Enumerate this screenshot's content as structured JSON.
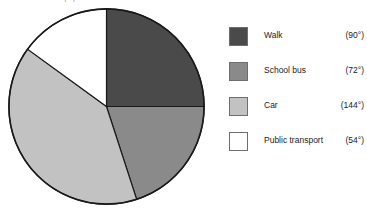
{
  "caption": {
    "text": "distribution of how pupils travel to school"
  },
  "chart_data": {
    "type": "pie",
    "title": "",
    "unit": "degrees",
    "total_degrees": 360,
    "start_angle_deg": 0,
    "direction": "clockwise",
    "legend_position": "right",
    "categories": [
      "Walk",
      "School bus",
      "Car",
      "Public transport"
    ],
    "values": [
      90,
      72,
      144,
      54
    ],
    "value_labels": [
      "(90°)",
      "(72°)",
      "(144°)",
      "(54°)"
    ],
    "colors": [
      "#4a4a4a",
      "#8a8a8a",
      "#c2c2c2",
      "#ffffff"
    ],
    "outline_color": "#1a1a1a",
    "slices": [
      {
        "label": "Walk",
        "degrees": 90,
        "value_label": "(90°)",
        "color": "#4a4a4a",
        "start_deg": 0,
        "end_deg": 90
      },
      {
        "label": "School bus",
        "degrees": 72,
        "value_label": "(72°)",
        "color": "#8a8a8a",
        "start_deg": 90,
        "end_deg": 162
      },
      {
        "label": "Car",
        "degrees": 144,
        "value_label": "(144°)",
        "color": "#c2c2c2",
        "start_deg": 162,
        "end_deg": 306
      },
      {
        "label": "Public transport",
        "degrees": 54,
        "value_label": "(54°)",
        "color": "#ffffff",
        "start_deg": 306,
        "end_deg": 360
      }
    ]
  },
  "legend": {
    "rows": [
      {
        "label": "Walk",
        "value": "(90°)",
        "color": "#4a4a4a"
      },
      {
        "label": "School bus",
        "value": "(72°)",
        "color": "#8a8a8a"
      },
      {
        "label": "Car",
        "value": "(144°)",
        "color": "#c2c2c2"
      },
      {
        "label": "Public transport",
        "value": "(54°)",
        "color": "#ffffff"
      }
    ]
  }
}
